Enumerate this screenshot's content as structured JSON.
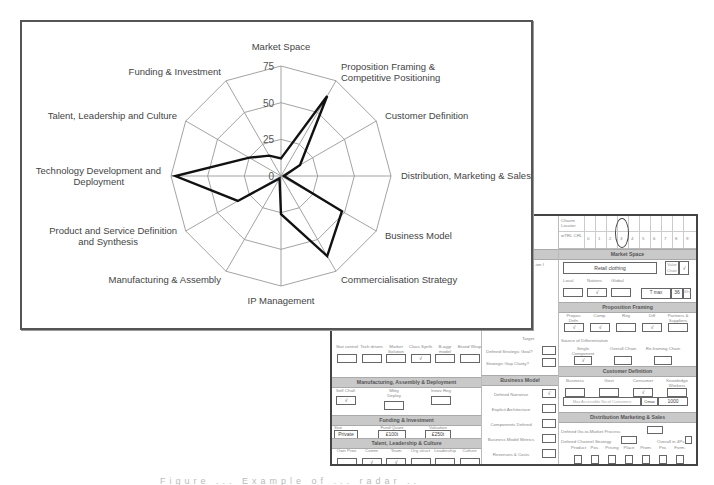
{
  "chart_data": {
    "type": "radar",
    "title": "",
    "categories": [
      "Market Space",
      "Proposition Framing & Competitive Positioning",
      "Customer Definition",
      "Distribution, Marketing & Sales",
      "Business Model",
      "Commercialisation Strategy",
      "IP Management",
      "Manufacturing & Assembly",
      "Product and Service Definition and Synthesis",
      "Technology Development and Deployment",
      "Talent, Leadership and Culture",
      "Funding & Investment"
    ],
    "category_lines": [
      [
        "Market Space"
      ],
      [
        "Proposition Framing &",
        "Competitive Positioning"
      ],
      [
        "Customer Definition"
      ],
      [
        "Distribution, Marketing & Sales"
      ],
      [
        "Business Model"
      ],
      [
        "Commercialisation Strategy"
      ],
      [
        "IP Management"
      ],
      [
        "Manufacturing & Assembly"
      ],
      [
        "Product and Service Definition",
        "and Synthesis"
      ],
      [
        "Technology Development and",
        "Deployment"
      ],
      [
        "Talent, Leadership and Culture"
      ],
      [
        "Funding & Investment"
      ]
    ],
    "series": [
      {
        "name": "Score",
        "values": [
          12,
          63,
          15,
          2,
          48,
          63,
          26,
          2,
          34,
          72,
          25,
          16
        ],
        "color": "#111111"
      }
    ],
    "rlim": [
      0,
      75
    ],
    "ticks": [
      0,
      25,
      50,
      75
    ],
    "grid": true,
    "legend": "none"
  },
  "form": {
    "chasm": {
      "row1_label": "Chasm Locator",
      "row2_label": "wTRL CRL",
      "numbers": [
        "0",
        "1",
        "2",
        "3",
        "4",
        "5",
        "6",
        "7",
        "8",
        "9"
      ]
    },
    "strategy_header": "...ategy",
    "strategy_field": "...ion I",
    "strategy_note": "Target",
    "strategy_q1": "Defined Strategic Goal?",
    "strategy_q2": "Strategic Gap Clarity?",
    "tech_labels": [
      "Stat control",
      "Tech driven",
      "Market Solution",
      "Class Synth",
      "B-aggr model",
      "Brand Wrap"
    ],
    "tech_values": [
      "",
      "",
      "",
      "√",
      "",
      ""
    ],
    "manufacturing": {
      "header": "Manufacturing, Assembly & Deployment",
      "labels": [
        "Self Chall.",
        "Mktg Deploy",
        "Innov Reg"
      ],
      "values": [
        "√",
        "",
        ""
      ]
    },
    "funding": {
      "header": "Funding & Investment",
      "labels": [
        "Stat",
        "Fund Quant",
        "Valuation"
      ],
      "values": [
        "Private",
        "£100t",
        "£250t"
      ]
    },
    "talent": {
      "header": "Talent, Leadership & Culture",
      "labels": [
        "Own Prior.",
        "Comm",
        "Team",
        "Org struct",
        "Leadership",
        "Culture"
      ],
      "values": [
        "",
        "√",
        "√",
        "",
        "",
        ""
      ]
    },
    "business_model": {
      "header": "Business Model",
      "rows": [
        {
          "label": "Defined Narrative",
          "value": "√"
        },
        {
          "label": "Explicit Architecture",
          "value": ""
        },
        {
          "label": "Components Defined",
          "value": ""
        },
        {
          "label": "Business Model Metrics",
          "value": ""
        },
        {
          "label": "Revenues & Costs",
          "value": ""
        },
        {
          "label": "Cash Flow Projections",
          "value": ""
        }
      ]
    },
    "market_space": {
      "header": "Market Space",
      "sector": "Retail clothing",
      "value_chain_label": "Value Chain",
      "value_chain_value": "√",
      "scope_labels": [
        "Local",
        "Nations",
        "Global"
      ],
      "scope_values": [
        "",
        "√",
        ""
      ],
      "time_label": "T max",
      "time_value": "36",
      "time_unit": "Mths"
    },
    "proposition": {
      "header": "Proposition Framing",
      "labels": [
        "Propos. Defn.",
        "Comp.",
        "Reg",
        "Diff",
        "Partners & Suppliers"
      ],
      "values": [
        "√",
        "√",
        "",
        "√",
        ""
      ],
      "diff_source_label": "Source of Differentiation",
      "diff_labels": [
        "Single Component",
        "Overall Chain",
        "Re-framing Chain"
      ],
      "diff_values": [
        "√",
        "",
        ""
      ]
    },
    "customer": {
      "header": "Customer Definition",
      "labels": [
        "Business",
        "Govt",
        "Consumer",
        "Knowledge Workers"
      ],
      "values": [
        "",
        "",
        "√",
        ""
      ],
      "max_label": "Max Accessible No of Customers",
      "cmax_label": "Cmax",
      "cmax_value": "1000"
    },
    "distribution": {
      "header": "Distribution Marketing & Sales",
      "q1": "Defined Go-to-Market Process",
      "q2": "Defined Channel Strategy",
      "q3": "Overall in 4Ps",
      "labels": [
        "Product",
        "Pos.",
        "Pricing",
        "Place",
        "Prom.",
        "Pro.",
        "Form."
      ]
    }
  },
  "caption": "Figure ... Example of ... radar ... chart ..."
}
